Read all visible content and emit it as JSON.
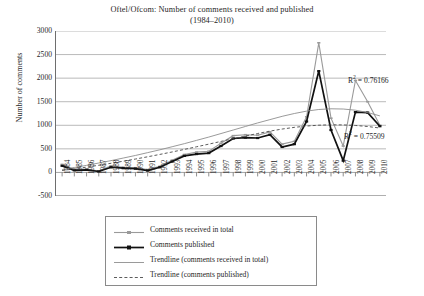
{
  "chart_data": {
    "type": "line",
    "title": "Oftel/Ofcom: Number of comments received and published",
    "subtitle": "(1984–2010)",
    "xlabel": "",
    "ylabel": "Number of comments",
    "ylim": [
      -500,
      3000
    ],
    "ytick_step": 500,
    "yticks": [
      "3000",
      "2500",
      "2000",
      "1500",
      "1000",
      "500",
      "0",
      "-500"
    ],
    "grid": true,
    "legend_position": "below",
    "categories": [
      "1984",
      "1985",
      "1986",
      "1987",
      "1988",
      "1989",
      "1990",
      "1991",
      "1992",
      "1993",
      "1994",
      "1995",
      "1996",
      "1997",
      "1998",
      "1999",
      "2000",
      "2001",
      "2002",
      "2003",
      "2004",
      "2005",
      "2006",
      "2007",
      "2008",
      "2009",
      "2010"
    ],
    "series": [
      {
        "name": "Comments received in total",
        "color": "#9a9a9a",
        "style": "solid-marker",
        "values": [
          170,
          60,
          70,
          30,
          140,
          110,
          100,
          60,
          130,
          260,
          380,
          430,
          450,
          620,
          780,
          800,
          790,
          860,
          600,
          660,
          1180,
          2750,
          1150,
          560,
          1950,
          1500,
          1000
        ]
      },
      {
        "name": "Comments published",
        "color": "#111111",
        "style": "bold-marker",
        "values": [
          140,
          45,
          55,
          20,
          110,
          90,
          80,
          40,
          110,
          230,
          350,
          390,
          410,
          560,
          720,
          740,
          730,
          800,
          540,
          600,
          1080,
          2150,
          900,
          250,
          1280,
          1270,
          980
        ]
      },
      {
        "name": "Trendline (comments received in total)",
        "color": "#8f8f8f",
        "style": "trend-solid",
        "values": [
          60,
          105,
          150,
          200,
          250,
          305,
          360,
          420,
          480,
          545,
          610,
          680,
          750,
          825,
          900,
          975,
          1050,
          1120,
          1190,
          1250,
          1300,
          1335,
          1350,
          1345,
          1320,
          1270,
          1200
        ]
      },
      {
        "name": "Trendline (comments published)",
        "color": "#4a4a4a",
        "style": "trend-dashed",
        "values": [
          40,
          75,
          112,
          152,
          194,
          238,
          284,
          332,
          382,
          434,
          488,
          544,
          600,
          658,
          716,
          772,
          826,
          876,
          920,
          956,
          984,
          1002,
          1010,
          1008,
          996,
          974,
          942
        ]
      }
    ],
    "annotations": [
      {
        "name": "r2-received",
        "text": "R² = 0.76166",
        "label": "R",
        "sup": "2",
        "value": "= 0.76166"
      },
      {
        "name": "r2-published",
        "text": "R² = 0.75509",
        "label": "R",
        "sup": "2",
        "value": "= 0.75509"
      }
    ]
  },
  "legend": {
    "items": [
      {
        "label": "Comments received in total"
      },
      {
        "label": "Comments published"
      },
      {
        "label": "Trendline (comments received in total)"
      },
      {
        "label": "Trendline (comments published)"
      }
    ]
  }
}
